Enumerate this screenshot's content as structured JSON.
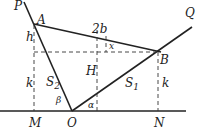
{
  "diagram": {
    "points": {
      "P": "P",
      "A": "A",
      "B": "B",
      "Q": "Q",
      "M": "M",
      "O": "O",
      "N": "N"
    },
    "segment_labels": {
      "AB": "2b",
      "angle_x": "x",
      "h": "h",
      "k_left": "k",
      "k_right": "k",
      "H": "H",
      "S1_main": "S",
      "S1_sub": "1",
      "S2_main": "S",
      "S2_sub": "2",
      "alpha": "α",
      "beta": "β"
    }
  }
}
